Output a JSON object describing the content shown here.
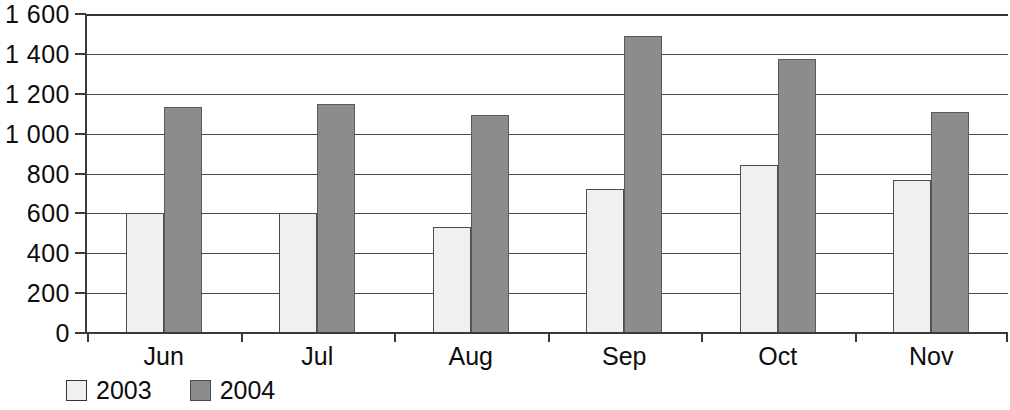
{
  "chart_data": {
    "type": "bar",
    "title": "",
    "subtitle": "",
    "xlabel": "",
    "ylabel": "",
    "categories": [
      "Jun",
      "Jul",
      "Aug",
      "Sep",
      "Oct",
      "Nov"
    ],
    "series": [
      {
        "name": "2003",
        "color": "#f0f0ee",
        "values": [
          600,
          600,
          530,
          720,
          845,
          765
        ]
      },
      {
        "name": "2004",
        "color": "#8c8c8c",
        "values": [
          1135,
          1150,
          1095,
          1490,
          1375,
          1110
        ]
      }
    ],
    "ylim": [
      0,
      1600
    ],
    "ytick_step": 200,
    "yticks": [
      0,
      200,
      400,
      600,
      800,
      1000,
      1200,
      1400,
      1600
    ],
    "ytick_labels": [
      "0",
      "200",
      "400",
      "600",
      "800",
      "1 000",
      "1 200",
      "1 400",
      "1 600"
    ],
    "grid": true,
    "grid_axis": "y",
    "legend_position": "bottom-left",
    "legend": [
      "2003",
      "2004"
    ],
    "annotations": []
  },
  "legend": {
    "items": [
      {
        "label": "2003",
        "swatch": "light-square-swatch"
      },
      {
        "label": "2004",
        "swatch": "dark-square-swatch"
      }
    ]
  }
}
